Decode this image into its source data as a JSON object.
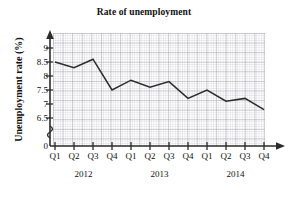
{
  "chart_data": {
    "type": "line",
    "title": "Rate of unemployment",
    "xlabel": "",
    "ylabel": "Unemployment rate (%)",
    "categories": [
      "Q1",
      "Q2",
      "Q3",
      "Q4",
      "Q1",
      "Q2",
      "Q3",
      "Q4",
      "Q1",
      "Q2",
      "Q3",
      "Q4"
    ],
    "values": [
      8.5,
      8.3,
      8.6,
      7.5,
      7.85,
      7.6,
      7.8,
      7.2,
      7.5,
      7.1,
      7.2,
      6.8
    ],
    "ytick_labels": [
      "0",
      "6.5",
      "7",
      "7.5",
      "8",
      "8.5",
      "9"
    ],
    "ytick_values": [
      0,
      6.5,
      7,
      7.5,
      8,
      8.5,
      9
    ],
    "ylim": [
      6.25,
      9.25
    ],
    "axis_break": true,
    "grid": true,
    "legend": "none",
    "group_labels": [
      "2012",
      "2013",
      "2014"
    ],
    "line_color": "#2b2b2b"
  },
  "chart": {
    "title": "Rate of unemployment",
    "y_axis_caption": "Unemployment rate (%)"
  }
}
